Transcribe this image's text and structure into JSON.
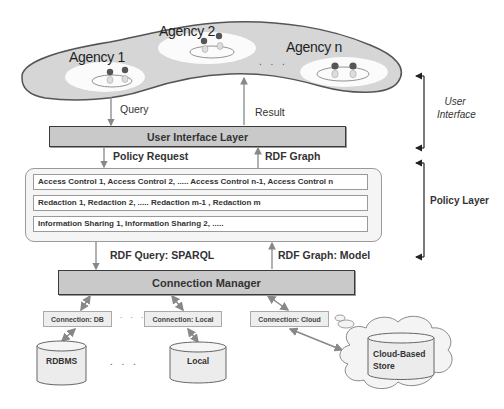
{
  "diagram": {
    "user_tier": {
      "agencies": [
        {
          "label": "Agency 1"
        },
        {
          "label": "Agency 2"
        },
        {
          "label": "Agency n"
        }
      ],
      "ellipsis": ". . ."
    },
    "flows": {
      "query": "Query",
      "result": "Result",
      "policy_request": "Policy Request",
      "rdf_graph": "RDF Graph",
      "rdf_query": "RDF Query: SPARQL",
      "rdf_graph_model": "RDF Graph: Model"
    },
    "layers": {
      "ui_layer": "User Interface Layer",
      "connection_manager": "Connection Manager"
    },
    "policy_rows": [
      "Access Control 1,   Access Control 2,   .....  Access Control n-1,   Access Control n",
      "Redaction 1,   Redaction 2,   .....  Redaction m-1 ,   Redaction m",
      "Information Sharing 1,   Information Sharing 2,     ....."
    ],
    "connections": [
      {
        "label": "Connection: DB"
      },
      {
        "label": "Connection: Local"
      },
      {
        "label": "Connection: Cloud"
      }
    ],
    "connection_ellipsis": ". . .",
    "stores": [
      {
        "label": "RDBMS"
      },
      {
        "label": "Local"
      },
      {
        "label": "Cloud-Based Store"
      }
    ],
    "store_ellipsis": ". . .",
    "brackets": {
      "user_interface": [
        "User",
        "Interface"
      ],
      "policy_layer": "Policy Layer"
    },
    "colors": {
      "layer_fill": "#c9c9c9",
      "blob_fill": "#d6d6d6",
      "arrow": "#888888",
      "border": "#3a3a3a"
    }
  }
}
